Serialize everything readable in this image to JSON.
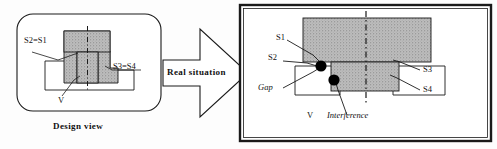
{
  "figure": {
    "title_left": "Design view",
    "arrow_label": "Real situation",
    "left_panel": {
      "labels": {
        "s2_s1": "S2=S1",
        "s3_s4": "S3=S4",
        "v": "V"
      }
    },
    "right_panel": {
      "labels": {
        "s1": "S1",
        "s2": "S2",
        "gap": "Gap",
        "s3": "S3",
        "s4": "S4",
        "v": "V",
        "interference": "Interference"
      }
    },
    "colors": {
      "stroke": "#1a1a1a",
      "hatch_fill": "#b8b8b8",
      "marker": "#000000",
      "background": "#ffffff"
    }
  }
}
